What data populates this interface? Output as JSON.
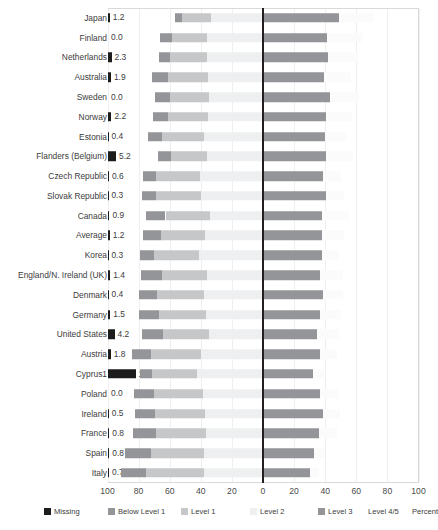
{
  "chart_data": {
    "type": "bar",
    "subtype": "diverging-stacked-horizontal",
    "title": "",
    "xlabel": "Percent",
    "ylabel": "",
    "grid": true,
    "legend_position": "bottom",
    "xlim": [
      -100,
      100
    ],
    "xticks": [
      "100",
      "80",
      "60",
      "40",
      "20",
      "0",
      "20",
      "40",
      "60",
      "80",
      "100"
    ],
    "xtick_values": [
      -100,
      -80,
      -60,
      -40,
      -20,
      0,
      20,
      40,
      60,
      80,
      100
    ],
    "axis_note": "left of zero = Below Level 1 + Level 1 + Level 2; right of zero = Level 3 + Level 4/5",
    "series": [
      {
        "name": "Missing",
        "color": "#1c1c1c"
      },
      {
        "name": "Below Level 1",
        "color": "#939598"
      },
      {
        "name": "Level 1",
        "color": "#c6c7c9"
      },
      {
        "name": "Level 2",
        "color": "#eeeff0"
      },
      {
        "name": "Level 3",
        "color": "#939598"
      },
      {
        "name": "Level 4/5",
        "color": "#fbfbfb"
      }
    ],
    "categories": [
      "Japan",
      "Finland",
      "Netherlands",
      "Australia",
      "Sweden",
      "Norway",
      "Estonia",
      "Flanders (Belgium)",
      "Czech Republic",
      "Slovak Republic",
      "Canada",
      "Average",
      "Korea",
      "England/N. Ireland (UK)",
      "Denmark",
      "Germany",
      "United States",
      "Austria",
      "Cyprus1",
      "Poland",
      "Ireland",
      "France",
      "Spain",
      "Italy"
    ],
    "rows": [
      {
        "label": "Japan",
        "missing": 1.2,
        "missing_text": "1.2",
        "below1": 4.3,
        "level1": 18.9,
        "level2": 33.5,
        "level3": 48.6,
        "level45": 23.0
      },
      {
        "label": "Finland",
        "missing": 0.0,
        "missing_text": "0.0",
        "below1": 8.1,
        "level1": 22.5,
        "level2": 35.8,
        "level3": 41.4,
        "level45": 22.1
      },
      {
        "label": "Netherlands",
        "missing": 2.3,
        "missing_text": "2.3",
        "below1": 7.0,
        "level1": 23.7,
        "level2": 35.9,
        "level3": 42.0,
        "level45": 19.0
      },
      {
        "label": "Australia",
        "missing": 1.9,
        "missing_text": "1.9",
        "below1": 10.6,
        "level1": 25.7,
        "level2": 35.1,
        "level3": 39.1,
        "level45": 17.6
      },
      {
        "label": "Sweden",
        "missing": 0.0,
        "missing_text": "0.0",
        "below1": 9.4,
        "level1": 25.6,
        "level2": 34.5,
        "level3": 42.9,
        "level45": 19.1
      },
      {
        "label": "Norway",
        "missing": 2.2,
        "missing_text": "2.2",
        "below1": 9.7,
        "level1": 26.2,
        "level2": 35.1,
        "level3": 40.8,
        "level45": 16.6
      },
      {
        "label": "Estonia",
        "missing": 0.4,
        "missing_text": "0.4",
        "below1": 9.3,
        "level1": 26.8,
        "level2": 38.1,
        "level3": 39.8,
        "level45": 13.8
      },
      {
        "label": "Flanders (Belgium)",
        "missing": 5.2,
        "missing_text": "5.2",
        "below1": 8.1,
        "level1": 23.0,
        "level2": 36.2,
        "level3": 40.6,
        "level45": 17.6
      },
      {
        "label": "Czech Republic",
        "missing": 0.6,
        "missing_text": "0.6",
        "below1": 8.7,
        "level1": 28.4,
        "level2": 40.2,
        "level3": 38.6,
        "level45": 11.5
      },
      {
        "label": "Slovak Republic",
        "missing": 0.3,
        "missing_text": "0.3",
        "below1": 9.5,
        "level1": 28.7,
        "level2": 39.9,
        "level3": 40.8,
        "level45": 11.1
      },
      {
        "label": "Canada",
        "missing": 0.9,
        "missing_text": "0.9",
        "below1": 12.6,
        "level1": 28.5,
        "level2": 34.2,
        "level3": 38.2,
        "level45": 17.2
      },
      {
        "label": "Average",
        "missing": 1.2,
        "missing_text": "1.2",
        "below1": 11.8,
        "level1": 28.2,
        "level2": 37.1,
        "level3": 38.2,
        "level45": 14.2
      },
      {
        "label": "Korea",
        "missing": 0.3,
        "missing_text": "0.3",
        "below1": 8.4,
        "level1": 29.4,
        "level2": 41.0,
        "level3": 38.2,
        "level45": 11.0
      },
      {
        "label": "England/N. Ireland (UK)",
        "missing": 1.4,
        "missing_text": "1.4",
        "below1": 13.4,
        "level1": 29.4,
        "level2": 35.8,
        "level3": 36.6,
        "level45": 15.1
      },
      {
        "label": "Denmark",
        "missing": 0.4,
        "missing_text": "0.4",
        "below1": 11.6,
        "level1": 30.4,
        "level2": 38.0,
        "level3": 38.4,
        "level45": 13.3
      },
      {
        "label": "Germany",
        "missing": 1.5,
        "missing_text": "1.5",
        "below1": 13.4,
        "level1": 30.2,
        "level2": 36.4,
        "level3": 36.4,
        "level45": 13.9
      },
      {
        "label": "United States",
        "missing": 4.2,
        "missing_text": "4.2",
        "below1": 13.6,
        "level1": 29.6,
        "level2": 34.8,
        "level3": 35.0,
        "level45": 13.6
      },
      {
        "label": "Austria",
        "missing": 1.8,
        "missing_text": "1.8",
        "below1": 12.2,
        "level1": 31.8,
        "level2": 40.1,
        "level3": 36.6,
        "level45": 10.8
      },
      {
        "label": "Cyprus1",
        "missing": 17.7,
        "missing_text": "17.7",
        "below1": 7.7,
        "level1": 29.1,
        "level2": 42.5,
        "level3": 32.2,
        "level45": 7.0
      },
      {
        "label": "Poland",
        "missing": 0.0,
        "missing_text": "0.0",
        "below1": 13.2,
        "level1": 31.6,
        "level2": 38.4,
        "level3": 36.9,
        "level45": 11.3
      },
      {
        "label": "Ireland",
        "missing": 0.5,
        "missing_text": "0.5",
        "below1": 13.2,
        "level1": 31.6,
        "level2": 37.6,
        "level3": 38.5,
        "level45": 11.0
      },
      {
        "label": "France",
        "missing": 0.8,
        "missing_text": "0.8",
        "below1": 14.8,
        "level1": 32.2,
        "level2": 36.4,
        "level3": 36.1,
        "level45": 11.2
      },
      {
        "label": "Spain",
        "missing": 0.8,
        "missing_text": "0.8",
        "below1": 17.0,
        "level1": 34.1,
        "level2": 37.8,
        "level3": 32.6,
        "level45": 7.5
      },
      {
        "label": "Italy",
        "missing": 0.7,
        "missing_text": "0.7",
        "below1": 16.3,
        "level1": 37.3,
        "level2": 37.9,
        "level3": 30.5,
        "level45": 5.4
      }
    ]
  },
  "legend": {
    "items": [
      {
        "label": "Missing",
        "color": "#1c1c1c",
        "show_swatch": true
      },
      {
        "label": "Below Level 1",
        "color": "#939598",
        "show_swatch": true
      },
      {
        "label": "Level 1",
        "color": "#c6c7c9",
        "show_swatch": true
      },
      {
        "label": "Level 2",
        "color": "#eeeff0",
        "show_swatch": true
      },
      {
        "label": "Level 3",
        "color": "#939598",
        "show_swatch": true
      },
      {
        "label": "Level 4/5",
        "color": "#fbfbfb",
        "show_swatch": false
      },
      {
        "label": "Percent",
        "color": "#ffffff",
        "show_swatch": false
      }
    ]
  }
}
